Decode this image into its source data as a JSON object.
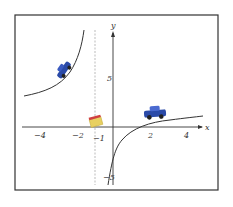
{
  "figure": {
    "type": "function-graph",
    "axes": {
      "x_label": "x",
      "y_label": "y",
      "x_ticks": [
        "−4",
        "−2",
        "2",
        "4"
      ],
      "y_ticks": [
        "5",
        "−5"
      ],
      "asymptote_label": "−1"
    },
    "colors": {
      "frame": "#333333",
      "curve": "#333333",
      "asymptote": "#999999",
      "car": "#2a4aa8",
      "sign_fill": "#e8d060",
      "sign_top": "#d04040"
    }
  }
}
